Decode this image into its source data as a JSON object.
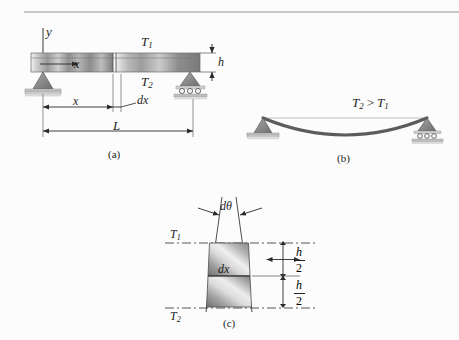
{
  "figure": {
    "background_color": "#fcfcfc",
    "ink_color": "#1c1c1c",
    "rule_color": "#c8c8c8"
  },
  "panel_a": {
    "caption": "(a)",
    "axis_label_y": "y",
    "beam_label_x": "x",
    "temp_top": "T",
    "temp_top_sub": "1",
    "temp_bottom": "T",
    "temp_bottom_sub": "2",
    "depth_label": "h",
    "dim_x": "x",
    "dim_dx": "dx",
    "dim_L": "L",
    "support_left": "pin-support",
    "support_right": "roller-support"
  },
  "panel_b": {
    "caption": "(b)",
    "inequality_lhs": "T",
    "inequality_lhs_sub": "2",
    "inequality_op": ">",
    "inequality_rhs": "T",
    "inequality_rhs_sub": "1",
    "support_left": "pin-support",
    "support_right": "roller-support"
  },
  "panel_c": {
    "caption": "(c)",
    "angle_label": "dθ",
    "element_label": "dx",
    "temp_top": "T",
    "temp_top_sub": "1",
    "temp_bottom": "T",
    "temp_bottom_sub": "2",
    "half_depth_upper_num": "h",
    "half_depth_upper_den": "2",
    "half_depth_lower_num": "h",
    "half_depth_lower_den": "2"
  }
}
